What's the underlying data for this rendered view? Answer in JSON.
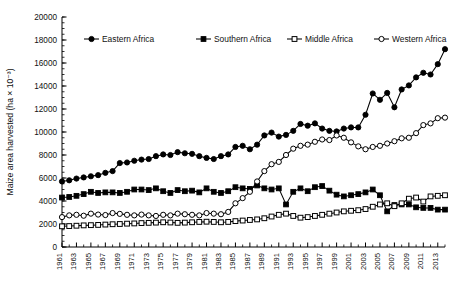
{
  "chart_data": {
    "type": "line",
    "title": "",
    "xlabel": "",
    "ylabel": "Maize area harvested (ha × 10⁻³)",
    "ylim": [
      0,
      20000
    ],
    "ytick_step": 2000,
    "yminor_step": 500,
    "xlim": [
      1961,
      2014
    ],
    "grid": false,
    "legend_position": "top-inside",
    "ytick_labels": [
      "0",
      "2000",
      "4000",
      "6000",
      "8000",
      "10000",
      "12000",
      "14000",
      "16000",
      "18000",
      "20000"
    ],
    "xtick_labels": [
      "1961",
      "1963",
      "1965",
      "1967",
      "1969",
      "1971",
      "1973",
      "1975",
      "1977",
      "1979",
      "1981",
      "1983",
      "1985",
      "1987",
      "1989",
      "1991",
      "1993",
      "1995",
      "1997",
      "1999",
      "2001",
      "2003",
      "2005",
      "2007",
      "2009",
      "2011",
      "2013"
    ],
    "x": [
      1961,
      1962,
      1963,
      1964,
      1965,
      1966,
      1967,
      1968,
      1969,
      1970,
      1971,
      1972,
      1973,
      1974,
      1975,
      1976,
      1977,
      1978,
      1979,
      1980,
      1981,
      1982,
      1983,
      1984,
      1985,
      1986,
      1987,
      1988,
      1989,
      1990,
      1991,
      1992,
      1993,
      1994,
      1995,
      1996,
      1997,
      1998,
      1999,
      2000,
      2001,
      2002,
      2003,
      2004,
      2005,
      2006,
      2007,
      2008,
      2009,
      2010,
      2011,
      2012,
      2013,
      2014
    ],
    "series": [
      {
        "name": "Eastern Africa",
        "marker": "filled-circle",
        "values": [
          5700,
          5800,
          5950,
          6050,
          6150,
          6250,
          6450,
          6600,
          7300,
          7350,
          7500,
          7600,
          7650,
          7900,
          8050,
          8000,
          8250,
          8150,
          8100,
          7900,
          7750,
          7650,
          7900,
          8050,
          8700,
          8800,
          8500,
          8900,
          9700,
          9950,
          9600,
          9750,
          10100,
          10700,
          10550,
          10750,
          10300,
          10100,
          10050,
          10300,
          10400,
          10400,
          11500,
          13350,
          12800,
          13400,
          12150,
          13700,
          14050,
          14750,
          15150,
          15000,
          15900,
          17200
        ]
      },
      {
        "name": "Southern Africa",
        "marker": "filled-square",
        "values": [
          4300,
          4350,
          4450,
          4600,
          4800,
          4700,
          4750,
          4750,
          4700,
          4800,
          5000,
          5000,
          4950,
          5100,
          4850,
          4700,
          4950,
          4850,
          4900,
          4750,
          5100,
          4800,
          4700,
          4850,
          5200,
          5100,
          5050,
          5350,
          5100,
          5000,
          5100,
          3700,
          4800,
          5100,
          4850,
          5200,
          5300,
          4900,
          4550,
          4400,
          4500,
          4600,
          4750,
          5000,
          4500,
          3100,
          3650,
          3700,
          3700,
          3450,
          3400,
          3400,
          3250,
          3250
        ]
      },
      {
        "name": "Middle Africa",
        "marker": "open-square",
        "values": [
          1800,
          1820,
          1850,
          1880,
          1900,
          1920,
          1950,
          1980,
          2000,
          2030,
          2050,
          2080,
          2100,
          2120,
          2150,
          2130,
          2100,
          2120,
          2150,
          2180,
          2200,
          2180,
          2150,
          2180,
          2250,
          2300,
          2350,
          2400,
          2500,
          2650,
          2800,
          2900,
          2700,
          2550,
          2600,
          2700,
          2800,
          2900,
          3000,
          3100,
          3150,
          3200,
          3300,
          3500,
          3700,
          3800,
          3550,
          3800,
          4200,
          4300,
          3950,
          4400,
          4450,
          4500
        ]
      },
      {
        "name": "Western Africa",
        "marker": "open-circle",
        "values": [
          2600,
          2750,
          2800,
          2720,
          2900,
          2820,
          2780,
          2950,
          2880,
          2800,
          2750,
          2820,
          2750,
          2700,
          2800,
          2750,
          2900,
          2850,
          2800,
          2750,
          2950,
          2900,
          2850,
          3050,
          3800,
          4250,
          4800,
          5700,
          6600,
          7200,
          7400,
          8000,
          8550,
          8800,
          8900,
          9150,
          9350,
          9300,
          9700,
          9500,
          9100,
          8750,
          8500,
          8700,
          8800,
          9000,
          9200,
          9450,
          9500,
          9900,
          10600,
          10750,
          11200,
          11250
        ]
      }
    ]
  },
  "legend": {
    "items": [
      {
        "label": "Eastern Africa",
        "marker": "filled-circle"
      },
      {
        "label": "Southern Africa",
        "marker": "filled-square"
      },
      {
        "label": "Middle Africa",
        "marker": "open-square"
      },
      {
        "label": "Western Africa",
        "marker": "open-circle"
      }
    ]
  }
}
